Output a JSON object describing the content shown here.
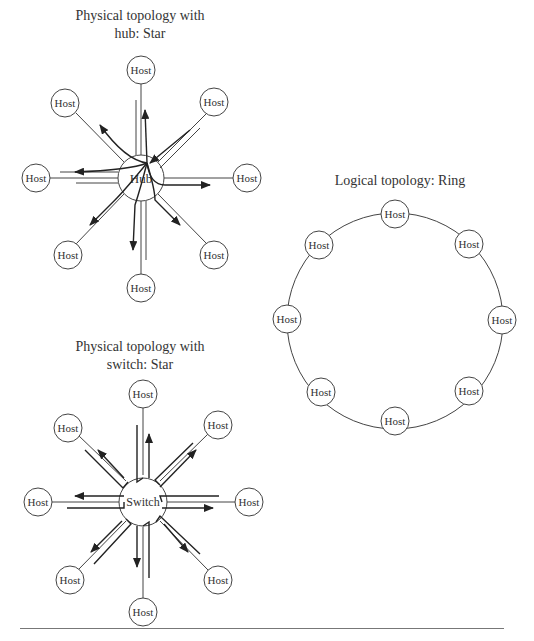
{
  "diagrams": {
    "hub_star": {
      "title_line1": "Physical topology with",
      "title_line2": "hub: Star",
      "center_label": "Hub",
      "hosts": [
        "Host",
        "Host",
        "Host",
        "Host",
        "Host",
        "Host",
        "Host",
        "Host"
      ]
    },
    "switch_star": {
      "title_line1": "Physical topology with",
      "title_line2": "switch: Star",
      "center_label": "Switch",
      "hosts": [
        "Host",
        "Host",
        "Host",
        "Host",
        "Host",
        "Host",
        "Host",
        "Host"
      ]
    },
    "ring": {
      "title": "Logical topology: Ring",
      "hosts": [
        "Host",
        "Host",
        "Host",
        "Host",
        "Host",
        "Host",
        "Host",
        "Host"
      ]
    }
  },
  "colors": {
    "stroke": "#333333",
    "background": "#ffffff"
  }
}
